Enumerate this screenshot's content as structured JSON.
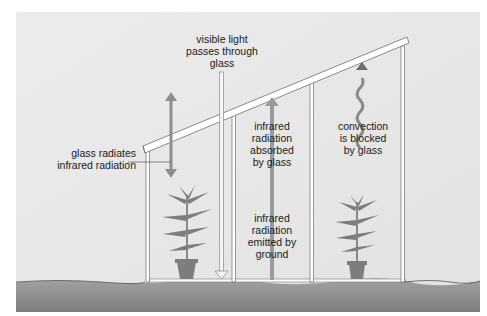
{
  "diagram": {
    "colors": {
      "background": "#e6e6e6",
      "ground_top": "#9a9a9a",
      "ground_bottom": "#7f7f7f",
      "frame": "#ffffff",
      "frame_outline": "#6e6e6e",
      "arrow": "#8a8a8a",
      "plant": "#7d7d7d",
      "text": "#1a1a1a"
    },
    "labels": {
      "visible_light": "visible light\npasses through\nglass",
      "glass_radiates": "glass radiates\ninfrared radiation",
      "ir_absorbed": "infrared\nradiation\nabsorbed\nby glass",
      "convection": "convection\nis blocked\nby glass",
      "ir_emitted": "infrared\nradiation\nemitted by\nground"
    }
  }
}
